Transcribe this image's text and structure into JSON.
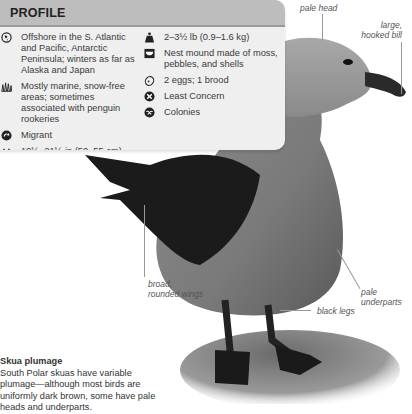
{
  "profile": {
    "title": "PROFILE",
    "left": [
      {
        "icon": "globe-range-icon",
        "text": "Offshore in the S. Atlantic and Pacific, Antarctic Peninsula; winters as far as Alaska and Japan"
      },
      {
        "icon": "habitat-grass-icon",
        "text": "Mostly marine, snow-free areas; sometimes associated with penguin rookeries"
      },
      {
        "icon": "migrant-arrow-icon",
        "text": "Migrant"
      },
      {
        "icon": "length-arrows-icon",
        "text": "19½–21½ in (50–55 cm)"
      }
    ],
    "right": [
      {
        "icon": "weight-icon",
        "text": "2–3½ lb (0.9–1.6 kg)"
      },
      {
        "icon": "nest-icon",
        "text": "Nest mound made of moss, pebbles, and shells"
      },
      {
        "icon": "egg-icon",
        "text": "2 eggs; 1 brood"
      },
      {
        "icon": "conservation-status-icon",
        "text": "Least Concern"
      },
      {
        "icon": "colonies-icon",
        "text": "Colonies"
      }
    ]
  },
  "labels": {
    "pale_head": "pale head",
    "bill_1": "large,",
    "bill_2": "hooked bill",
    "wings_1": "broad,",
    "wings_2": "rounded wings",
    "underparts": "pale underparts",
    "legs": "black legs"
  },
  "caption": {
    "title": "Skua plumage",
    "body": "South Polar skuas have variable plumage—although most birds are uniformly dark brown, some have pale heads and underparts."
  },
  "colors": {
    "card_bg": "#efefef",
    "card_header": "#bdbdbd"
  }
}
